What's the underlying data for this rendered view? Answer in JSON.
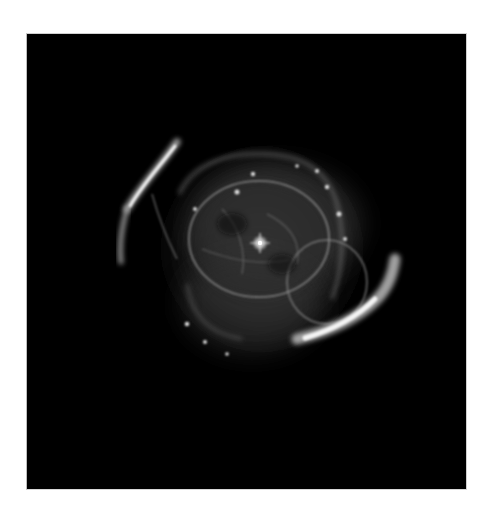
{
  "image": {
    "subject": "planetary nebula",
    "description": "Grayscale astronomical image of a planetary nebula with a bright central star, nested shell rings and two bright outer arcs on a black sky",
    "palette": {
      "background": "#ffffff",
      "sky": "#000000",
      "nebula": "#bfbfbf",
      "highlight": "#ffffff"
    }
  }
}
